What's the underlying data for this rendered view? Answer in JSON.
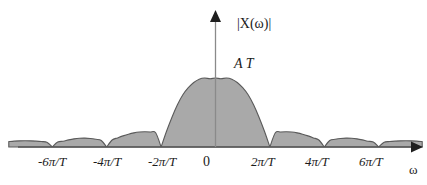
{
  "figure": {
    "name": "magnitude-spectrum-sinc",
    "background_color": "#ffffff",
    "curve_fill_color": "#a9a9a9",
    "curve_stroke_color": "#5a5a5a",
    "axis_color": "#595959"
  },
  "axes": {
    "y_axis_label": "|X(ω)|",
    "x_axis_label": "ω",
    "origin_label": "0",
    "peak_label": "A T",
    "x_ticks": [
      {
        "label": "-6π/T",
        "value": -6
      },
      {
        "label": "-4π/T",
        "value": -4
      },
      {
        "label": "-2π/T",
        "value": -2
      },
      {
        "label": "2π/T",
        "value": 2
      },
      {
        "label": "4π/T",
        "value": 4
      },
      {
        "label": "6π/T",
        "value": 6
      }
    ]
  },
  "chart_data": {
    "type": "area",
    "title": "",
    "subtitle": "",
    "xlabel": "ω",
    "ylabel": "|X(ω)|",
    "xlim": [
      -7.6,
      7.6
    ],
    "ylim": [
      0,
      1.15
    ],
    "grid": false,
    "legend": null,
    "annotations": [
      {
        "text": "A T",
        "x": 0,
        "y": 1.0,
        "note": "peak amplitude of main lobe"
      },
      {
        "text": "0",
        "x": 0,
        "y": 0,
        "note": "origin tick label"
      }
    ],
    "xticks": [
      -6,
      -4,
      -2,
      2,
      4,
      6
    ],
    "xticklabels": [
      "-6π/T",
      "-4π/T",
      "-2π/T",
      "2π/T",
      "4π/T",
      "6π/T"
    ],
    "yticks": [
      1.0
    ],
    "yticklabels": [
      "A T"
    ],
    "series": [
      {
        "name": "|X(ω)| = |A T sinc(ωT/2)|",
        "function": "abs(sin(pi*x/2)/(pi*x/2))",
        "fill": true,
        "zeros": [
          -6,
          -4,
          -2,
          2,
          4,
          6
        ],
        "lobe_peaks": [
          {
            "x": 0,
            "y": 1.0
          },
          {
            "x": -3.0,
            "y": 0.217
          },
          {
            "x": 3.0,
            "y": 0.217
          },
          {
            "x": -5.0,
            "y": 0.128
          },
          {
            "x": 5.0,
            "y": 0.128
          },
          {
            "x": -7.0,
            "y": 0.091
          },
          {
            "x": 7.0,
            "y": 0.091
          }
        ],
        "x": [
          -7.6,
          -7.4,
          -7.2,
          -7.0,
          -6.8,
          -6.6,
          -6.4,
          -6.2,
          -6.0,
          -5.8,
          -5.6,
          -5.4,
          -5.2,
          -5.0,
          -4.8,
          -4.6,
          -4.4,
          -4.2,
          -4.0,
          -3.8,
          -3.6,
          -3.4,
          -3.2,
          -3.0,
          -2.8,
          -2.6,
          -2.4,
          -2.2,
          -2.0,
          -1.8,
          -1.6,
          -1.4,
          -1.2,
          -1.0,
          -0.8,
          -0.6,
          -0.4,
          -0.2,
          0.0,
          0.2,
          0.4,
          0.6,
          0.8,
          1.0,
          1.2,
          1.4,
          1.6,
          1.8,
          2.0,
          2.2,
          2.4,
          2.6,
          2.8,
          3.0,
          3.2,
          3.4,
          3.6,
          3.8,
          4.0,
          4.2,
          4.4,
          4.6,
          4.8,
          5.0,
          5.2,
          5.4,
          5.6,
          5.8,
          6.0,
          6.2,
          6.4,
          6.6,
          6.8,
          7.0,
          7.2,
          7.4,
          7.6
        ],
        "y": [
          0.079,
          0.085,
          0.089,
          0.091,
          0.089,
          0.085,
          0.079,
          0.07,
          0.0,
          0.071,
          0.084,
          0.103,
          0.118,
          0.127,
          0.129,
          0.124,
          0.112,
          0.095,
          0.0,
          0.101,
          0.132,
          0.161,
          0.186,
          0.205,
          0.217,
          0.222,
          0.218,
          0.206,
          0.0,
          0.228,
          0.432,
          0.612,
          0.757,
          0.859,
          0.935,
          0.983,
          1.0,
          0.99,
          1.0,
          0.99,
          1.0,
          0.983,
          0.935,
          0.859,
          0.757,
          0.612,
          0.432,
          0.228,
          0.0,
          0.206,
          0.218,
          0.222,
          0.217,
          0.205,
          0.186,
          0.161,
          0.132,
          0.101,
          0.0,
          0.095,
          0.112,
          0.124,
          0.129,
          0.127,
          0.118,
          0.103,
          0.084,
          0.071,
          0.0,
          0.07,
          0.079,
          0.085,
          0.089,
          0.091,
          0.089,
          0.085,
          0.079
        ]
      }
    ]
  }
}
